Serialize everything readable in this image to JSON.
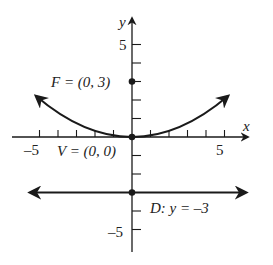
{
  "axes": {
    "x_label": "x",
    "y_label": "y",
    "x_tick_labels": {
      "neg": "–5",
      "pos": "5"
    },
    "y_tick_labels": {
      "pos": "5",
      "neg": "–5"
    },
    "range": [
      -6,
      6
    ]
  },
  "labels": {
    "focus": "F = (0, 3)",
    "vertex": "V = (0, 0)",
    "directrix": "D: y = –3"
  },
  "curve": {
    "equation": "x^2 = 12y",
    "focus": [
      0,
      3
    ],
    "vertex": [
      0,
      0
    ],
    "directrix_y": -3,
    "x_extent": [
      -5.5,
      5.5
    ]
  },
  "colors": {
    "ink": "#1a1a1a",
    "background": "#ffffff"
  }
}
